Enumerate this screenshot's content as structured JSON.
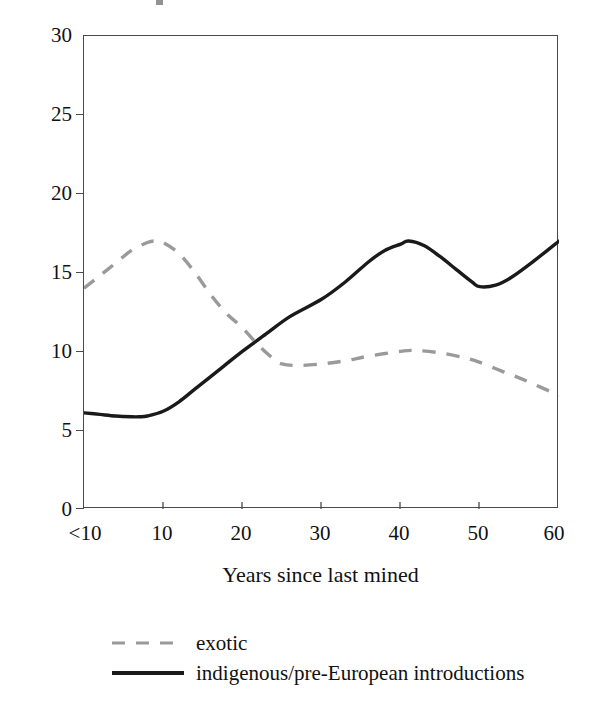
{
  "chart_data": {
    "type": "line",
    "title": "",
    "subtitle": "",
    "xlabel": "Years since last mined",
    "ylabel": "",
    "categories": [
      "<10",
      "10",
      "20",
      "30",
      "40",
      "50",
      "60"
    ],
    "x": [
      0,
      10,
      20,
      30,
      40,
      50,
      60
    ],
    "xlim": [
      0,
      60
    ],
    "ylim": [
      0,
      30
    ],
    "y_ticks": [
      0,
      5,
      10,
      15,
      20,
      25,
      30
    ],
    "x_tick_labels": [
      "<10",
      "10",
      "20",
      "30",
      "40",
      "50",
      "60"
    ],
    "grid": false,
    "legend_position": "below",
    "series": [
      {
        "name": "exotic",
        "color": "#9a9a9a",
        "style": "dashed",
        "values": [
          14.0,
          17.0,
          11.5,
          9.2,
          10.0,
          9.2,
          7.2
        ],
        "dense_x": [
          0,
          2,
          4,
          6,
          8,
          9,
          10,
          12,
          14,
          16,
          18,
          20,
          22,
          24,
          25,
          27,
          30,
          33,
          36,
          40,
          42,
          45,
          48,
          50,
          53,
          56,
          60
        ],
        "dense_values": [
          14.0,
          14.8,
          15.6,
          16.4,
          16.9,
          17.0,
          16.9,
          16.2,
          15.0,
          13.6,
          12.4,
          11.5,
          10.4,
          9.5,
          9.2,
          9.1,
          9.2,
          9.4,
          9.7,
          10.0,
          10.05,
          9.9,
          9.6,
          9.3,
          8.7,
          8.1,
          7.2
        ]
      },
      {
        "name": "indigenous/pre-European introductions",
        "color": "#1a1a1a",
        "style": "solid",
        "values": [
          6.1,
          6.2,
          10.0,
          13.3,
          16.8,
          14.1,
          17.0
        ],
        "dense_x": [
          0,
          2,
          4,
          6,
          7,
          8,
          10,
          12,
          14,
          16,
          18,
          20,
          23,
          26,
          30,
          33,
          36,
          38,
          40,
          41,
          43,
          45,
          47,
          49,
          50,
          52,
          54,
          57,
          60
        ],
        "dense_values": [
          6.1,
          6.0,
          5.9,
          5.85,
          5.85,
          5.9,
          6.2,
          6.8,
          7.6,
          8.4,
          9.2,
          10.0,
          11.1,
          12.2,
          13.3,
          14.4,
          15.7,
          16.4,
          16.8,
          17.0,
          16.7,
          16.0,
          15.2,
          14.4,
          14.1,
          14.2,
          14.7,
          15.8,
          17.0
        ]
      }
    ],
    "annotations": []
  },
  "axes": {
    "y_tick_labels": [
      "30",
      "25",
      "20",
      "15",
      "10",
      "5",
      "0"
    ],
    "x_tick_labels": [
      "<10",
      "10",
      "20",
      "30",
      "40",
      "50",
      "60"
    ],
    "x_title": "Years since last mined"
  },
  "legend": {
    "items": [
      {
        "label": "exotic",
        "style": "dashed",
        "color": "#9a9a9a"
      },
      {
        "label": "indigenous/pre-European introductions",
        "style": "solid",
        "color": "#1a1a1a"
      }
    ]
  },
  "colors": {
    "exotic": "#9a9a9a",
    "indigenous": "#1a1a1a",
    "axis": "#4a4a4a",
    "text": "#111111",
    "background": "#ffffff"
  }
}
